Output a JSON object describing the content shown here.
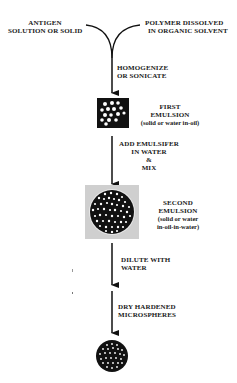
{
  "inputs": {
    "left": {
      "line1": "ANTIGEN",
      "line2": "SOLUTION OR SOLID"
    },
    "right": {
      "line1": "POLYMER DISSOLVED",
      "line2": "IN ORGANIC SOLVENT"
    }
  },
  "steps": [
    {
      "line1": "HOMOGENIZE",
      "line2": "OR SONICATE"
    },
    {
      "line1": "ADD EMULSIFER",
      "line2": "IN WATER",
      "line3": "&",
      "line4": "MIX"
    },
    {
      "line1": "DILUTE WITH",
      "line2": "WATER"
    },
    {
      "line1": "DRY HARDENED",
      "line2": "MICROSPHERES"
    }
  ],
  "stages": [
    {
      "title1": "FIRST",
      "title2": "EMULSION",
      "note": "(solid or water in-oil)"
    },
    {
      "title1": "SECOND",
      "title2": "EMULSION",
      "note1": "(solid or water",
      "note2": "in-oil-in-water)"
    }
  ],
  "colors": {
    "ink": "#111111",
    "background": "#ffffff",
    "panel": "#d0d0d0"
  }
}
